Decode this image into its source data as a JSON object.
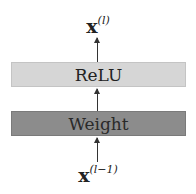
{
  "diagram": {
    "output_label": {
      "base": "x",
      "superscript": "(l)"
    },
    "input_label": {
      "base": "x",
      "superscript": "(l−1)"
    },
    "layers": [
      {
        "name": "ReLU",
        "fill": "#d6d6d6"
      },
      {
        "name": "Weight",
        "fill": "#8c8c8c"
      }
    ],
    "edges": [
      {
        "from": "input",
        "to": "Weight"
      },
      {
        "from": "Weight",
        "to": "ReLU"
      },
      {
        "from": "ReLU",
        "to": "output"
      }
    ]
  }
}
